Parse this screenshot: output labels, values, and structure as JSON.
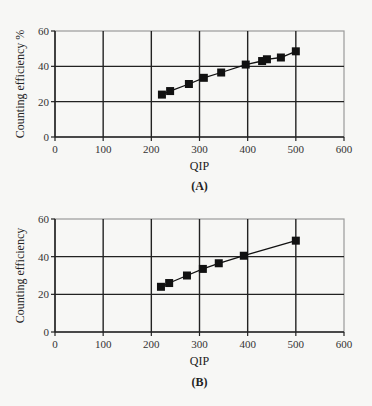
{
  "chart_data": [
    {
      "type": "line",
      "panel": "A",
      "caption": "(A)",
      "title": "",
      "xlabel": "QIP",
      "ylabel": "Counting efficiency %",
      "xlim": [
        0,
        600
      ],
      "ylim": [
        0,
        60
      ],
      "xticks": [
        "0",
        "100",
        "200",
        "300",
        "400",
        "500",
        "600"
      ],
      "yticks": [
        "0",
        "20",
        "40",
        "60"
      ],
      "grid": true,
      "marker": "square",
      "x": [
        222,
        239,
        278,
        309,
        345,
        396,
        430,
        440,
        469,
        500
      ],
      "y": [
        24,
        26,
        30,
        33.5,
        36.5,
        41,
        43,
        44,
        45,
        48.5
      ]
    },
    {
      "type": "line",
      "panel": "B",
      "caption": "(B)",
      "title": "",
      "xlabel": "QIP",
      "ylabel": "Counting efficiency",
      "xlim": [
        0,
        600
      ],
      "ylim": [
        0,
        60
      ],
      "xticks": [
        "0",
        "100",
        "200",
        "300",
        "400",
        "500",
        "600"
      ],
      "yticks": [
        "0",
        "20",
        "40",
        "60"
      ],
      "grid": true,
      "marker": "square",
      "x": [
        220,
        237,
        274,
        307,
        340,
        392,
        500
      ],
      "y": [
        24,
        26,
        30,
        33.5,
        36.5,
        40.5,
        48.5
      ]
    }
  ],
  "colors": {
    "line": "#111111",
    "grid": "#222222",
    "border": "#9a9a9a",
    "background": "#f7f7f5"
  }
}
